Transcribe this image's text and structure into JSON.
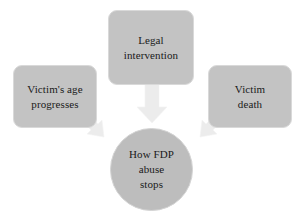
{
  "diagram": {
    "type": "concept-flow",
    "background_color": "#ffffff",
    "node_fill_color": "#c3c3c3",
    "circle_fill_color": "#bdbdbd",
    "arrow_fill_color": "#ececec",
    "text_color": "#1a1a1a",
    "nodes": [
      {
        "id": "legal-intervention",
        "shape": "rounded-rectangle",
        "label": "Legal\nintervention",
        "position": "top-center"
      },
      {
        "id": "victims-age",
        "shape": "rounded-rectangle",
        "label": "Victim's age\nprogresses",
        "position": "middle-left"
      },
      {
        "id": "victim-death",
        "shape": "rounded-rectangle",
        "label": "Victim\ndeath",
        "position": "middle-right"
      },
      {
        "id": "center-circle",
        "shape": "circle",
        "label": "How FDP\nabuse\nstops",
        "position": "bottom-center"
      }
    ],
    "arrows": [
      {
        "id": "arrow-legal-to-center",
        "from": "legal-intervention",
        "to": "center-circle",
        "direction": "down"
      },
      {
        "id": "arrow-age-to-center",
        "from": "victims-age",
        "to": "center-circle",
        "direction": "down-right"
      },
      {
        "id": "arrow-death-to-center",
        "from": "victim-death",
        "to": "center-circle",
        "direction": "down-left"
      }
    ]
  }
}
